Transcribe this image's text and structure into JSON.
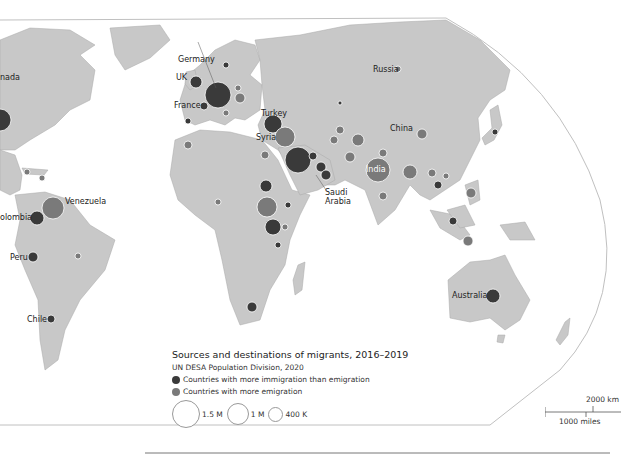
{
  "colors": {
    "land": "#c8c8c8",
    "border": "#9a9a9a",
    "ocean": "#ffffff",
    "immigration": "#3a3a3a",
    "emigration": "#7a7a7a",
    "frame": "#bdbdbd"
  },
  "labels": {
    "canada": "nada",
    "russia": "Russia",
    "germany": "Germany",
    "uk": "UK",
    "france": "France",
    "turkey": "Turkey",
    "syria": "Syria",
    "china": "China",
    "india": "India",
    "saudi_arabia_1": "Saudi",
    "saudi_arabia_2": "Arabia",
    "venezuela": "Venezuela",
    "colombia": "olombia",
    "peru": "Peru",
    "chile": "Chile",
    "australia": "Australia"
  },
  "legend": {
    "title": "Sources and destinations of migrants, 2016–2019",
    "subtitle": "UN DESA Population Division, 2020",
    "items": [
      {
        "label": "Countries with more immigration than emigration",
        "type": "immigration"
      },
      {
        "label": "Countries with more emigration",
        "type": "emigration"
      }
    ],
    "sizes": [
      {
        "label": "1.5 M",
        "diameter": 26
      },
      {
        "label": "1 M",
        "diameter": 20
      },
      {
        "label": "400 K",
        "diameter": 13
      }
    ]
  },
  "scale_bar": {
    "km_label": "2000 km",
    "miles_label": "1000 miles"
  },
  "bubbles": [
    {
      "name": "USA",
      "x": 0,
      "y": 120,
      "r": 11,
      "type": "immigration"
    },
    {
      "name": "Germany",
      "x": 218,
      "y": 95,
      "r": 13,
      "type": "immigration"
    },
    {
      "name": "UK",
      "x": 196,
      "y": 82,
      "r": 6,
      "type": "immigration"
    },
    {
      "name": "France",
      "x": 204,
      "y": 106,
      "r": 4,
      "type": "immigration"
    },
    {
      "name": "Turkey",
      "x": 273,
      "y": 124,
      "r": 9,
      "type": "immigration"
    },
    {
      "name": "Syria",
      "x": 285,
      "y": 137,
      "r": 10,
      "type": "emigration"
    },
    {
      "name": "Saudi Arabia",
      "x": 298,
      "y": 160,
      "r": 13,
      "type": "immigration"
    },
    {
      "name": "UAE",
      "x": 321,
      "y": 167,
      "r": 5,
      "type": "immigration"
    },
    {
      "name": "Kuwait",
      "x": 313,
      "y": 156,
      "r": 4,
      "type": "immigration"
    },
    {
      "name": "Oman",
      "x": 326,
      "y": 175,
      "r": 5,
      "type": "immigration"
    },
    {
      "name": "Iran",
      "x": 334,
      "y": 140,
      "r": 4,
      "type": "emigration"
    },
    {
      "name": "Afghanistan",
      "x": 358,
      "y": 140,
      "r": 6,
      "type": "emigration"
    },
    {
      "name": "Pakistan",
      "x": 350,
      "y": 157,
      "r": 5,
      "type": "emigration"
    },
    {
      "name": "India",
      "x": 378,
      "y": 170,
      "r": 12,
      "type": "emigration"
    },
    {
      "name": "Bangladesh",
      "x": 410,
      "y": 172,
      "r": 7,
      "type": "emigration"
    },
    {
      "name": "Nepal",
      "x": 383,
      "y": 153,
      "r": 4,
      "type": "emigration"
    },
    {
      "name": "China",
      "x": 422,
      "y": 134,
      "r": 5,
      "type": "emigration"
    },
    {
      "name": "Japan",
      "x": 495,
      "y": 132,
      "r": 3,
      "type": "immigration"
    },
    {
      "name": "Philippines",
      "x": 471,
      "y": 193,
      "r": 5,
      "type": "emigration"
    },
    {
      "name": "Malaysia",
      "x": 453,
      "y": 221,
      "r": 4,
      "type": "immigration"
    },
    {
      "name": "Indonesia",
      "x": 468,
      "y": 241,
      "r": 5,
      "type": "emigration"
    },
    {
      "name": "Thailand",
      "x": 438,
      "y": 185,
      "r": 4,
      "type": "immigration"
    },
    {
      "name": "Myanmar",
      "x": 432,
      "y": 173,
      "r": 4,
      "type": "emigration"
    },
    {
      "name": "Australia",
      "x": 493,
      "y": 296,
      "r": 7,
      "type": "immigration"
    },
    {
      "name": "Venezuela",
      "x": 53,
      "y": 208,
      "r": 11,
      "type": "emigration"
    },
    {
      "name": "Colombia",
      "x": 37,
      "y": 218,
      "r": 7,
      "type": "immigration"
    },
    {
      "name": "Peru",
      "x": 33,
      "y": 257,
      "r": 5,
      "type": "immigration"
    },
    {
      "name": "Chile",
      "x": 51,
      "y": 319,
      "r": 4,
      "type": "immigration"
    },
    {
      "name": "Brazil",
      "x": 78,
      "y": 256,
      "r": 3,
      "type": "emigration"
    },
    {
      "name": "Cuba",
      "x": 27,
      "y": 172,
      "r": 3,
      "type": "emigration"
    },
    {
      "name": "Haiti",
      "x": 42,
      "y": 178,
      "r": 3,
      "type": "emigration"
    },
    {
      "name": "Sudan",
      "x": 266,
      "y": 186,
      "r": 6,
      "type": "immigration"
    },
    {
      "name": "South Sudan",
      "x": 267,
      "y": 207,
      "r": 10,
      "type": "emigration"
    },
    {
      "name": "Uganda",
      "x": 273,
      "y": 227,
      "r": 8,
      "type": "immigration"
    },
    {
      "name": "Kenya",
      "x": 285,
      "y": 227,
      "r": 3,
      "type": "emigration"
    },
    {
      "name": "Ethiopia",
      "x": 288,
      "y": 205,
      "r": 3,
      "type": "immigration"
    },
    {
      "name": "Tanzania",
      "x": 278,
      "y": 245,
      "r": 3,
      "type": "immigration"
    },
    {
      "name": "Nigeria",
      "x": 218,
      "y": 202,
      "r": 3,
      "type": "emigration"
    },
    {
      "name": "South Africa",
      "x": 252,
      "y": 307,
      "r": 5,
      "type": "immigration"
    },
    {
      "name": "Morocco",
      "x": 188,
      "y": 145,
      "r": 4,
      "type": "emigration"
    },
    {
      "name": "Egypt",
      "x": 265,
      "y": 155,
      "r": 4,
      "type": "emigration"
    },
    {
      "name": "Romania",
      "x": 240,
      "y": 98,
      "r": 5,
      "type": "emigration"
    },
    {
      "name": "Poland",
      "x": 238,
      "y": 88,
      "r": 3,
      "type": "emigration"
    },
    {
      "name": "Italy",
      "x": 226,
      "y": 113,
      "r": 3,
      "type": "emigration"
    },
    {
      "name": "Spain",
      "x": 188,
      "y": 121,
      "r": 3,
      "type": "immigration"
    },
    {
      "name": "Sweden",
      "x": 226,
      "y": 65,
      "r": 3,
      "type": "immigration"
    },
    {
      "name": "Kazakhstan",
      "x": 340,
      "y": 103,
      "r": 2,
      "type": "immigration"
    },
    {
      "name": "Uzbekistan",
      "x": 340,
      "y": 130,
      "r": 4,
      "type": "emigration"
    },
    {
      "name": "Sri Lanka",
      "x": 383,
      "y": 196,
      "r": 4,
      "type": "emigration"
    },
    {
      "name": "Vietnam",
      "x": 446,
      "y": 176,
      "r": 3,
      "type": "emigration"
    },
    {
      "name": "Russia",
      "x": 398,
      "y": 69,
      "r": 3,
      "type": "emigration"
    }
  ]
}
